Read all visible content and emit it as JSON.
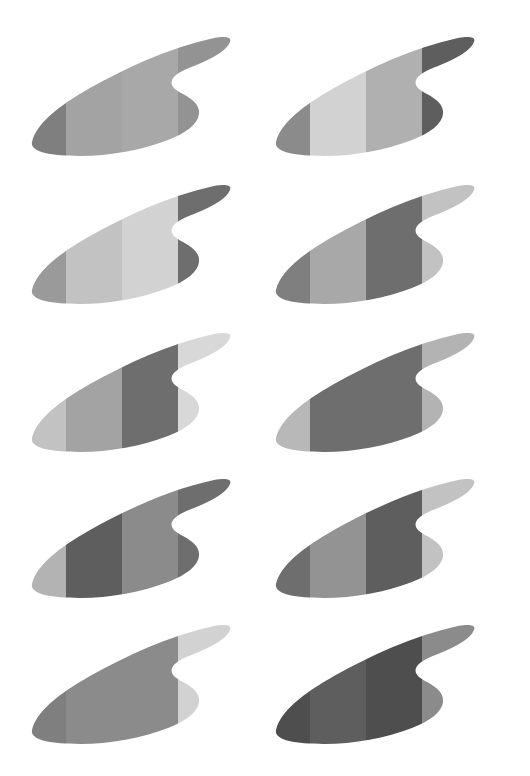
{
  "canvas": {
    "width": 530,
    "height": 776,
    "background": "#ffffff",
    "title": "Fin silhouette grid"
  },
  "grid": {
    "columns": 2,
    "rows": 5,
    "cell_width": 245,
    "cell_height": 150,
    "column_x": [
      18,
      262
    ],
    "row_y": [
      20,
      168,
      316,
      462,
      608
    ]
  },
  "shape": {
    "name": "banded-fin",
    "viewbox": "0 0 245 150",
    "outline_path": "M 14 122 C 18 104, 40 86, 72 68 C 108 48, 150 28, 196 18 C 208 16, 214 17, 212 22 C 209 30, 196 38, 176 46 C 163 51, 156 55, 154 60 C 152 66, 157 70, 165 74 C 176 80, 182 86, 181 94 C 180 104, 168 113, 150 120 C 124 130, 92 136, 62 136 C 32 136, 12 132, 14 122 Z",
    "band_boundaries_x": [
      48,
      104,
      160
    ],
    "band_count": 4,
    "band_label_left": "band-1",
    "band_label_mid_left": "band-2",
    "band_label_mid_right": "band-3",
    "band_label_right": "band-4"
  },
  "palette": {
    "lightest": "#e3e3e3",
    "very_light": "#d2d2d2",
    "light": "#c2c2c2",
    "light_mid": "#b3b3b3",
    "mid": "#a3a3a3",
    "mid_dark": "#939393",
    "dark_mid": "#7f7f7f",
    "dark": "#6e6e6e",
    "darker": "#5e5e5e",
    "darkest": "#4e4e4e",
    "white": "#ffffff"
  },
  "figures": [
    {
      "id": "fin-r1c1",
      "row": 1,
      "column": 1,
      "label": "fin-row1-left",
      "bands": [
        "#7f7f7f",
        "#a3a3a3",
        "#a8a8a8",
        "#939393"
      ]
    },
    {
      "id": "fin-r1c2",
      "row": 1,
      "column": 2,
      "label": "fin-row1-right",
      "bands": [
        "#8b8b8b",
        "#d2d2d2",
        "#b0b0b0",
        "#5e5e5e"
      ]
    },
    {
      "id": "fin-r2c1",
      "row": 2,
      "column": 1,
      "label": "fin-row2-left",
      "bands": [
        "#9a9a9a",
        "#c2c2c2",
        "#d2d2d2",
        "#6e6e6e"
      ]
    },
    {
      "id": "fin-r2c2",
      "row": 2,
      "column": 2,
      "label": "fin-row2-right",
      "bands": [
        "#7f7f7f",
        "#a8a8a8",
        "#6e6e6e",
        "#c2c2c2"
      ]
    },
    {
      "id": "fin-r3c1",
      "row": 3,
      "column": 1,
      "label": "fin-row3-left",
      "bands": [
        "#c2c2c2",
        "#a3a3a3",
        "#6e6e6e",
        "#d8d8d8"
      ]
    },
    {
      "id": "fin-r3c2",
      "row": 3,
      "column": 2,
      "label": "fin-row3-right",
      "bands": [
        "#b8b8b8",
        "#6e6e6e",
        "#6e6e6e",
        "#b3b3b3"
      ]
    },
    {
      "id": "fin-r4c1",
      "row": 4,
      "column": 1,
      "label": "fin-row4-left",
      "bands": [
        "#b3b3b3",
        "#5e5e5e",
        "#8b8b8b",
        "#6e6e6e"
      ]
    },
    {
      "id": "fin-r4c2",
      "row": 4,
      "column": 2,
      "label": "fin-row4-right",
      "bands": [
        "#6e6e6e",
        "#939393",
        "#5e5e5e",
        "#c2c2c2"
      ]
    },
    {
      "id": "fin-r5c1",
      "row": 5,
      "column": 1,
      "label": "fin-row5-left",
      "bands": [
        "#7f7f7f",
        "#8b8b8b",
        "#8b8b8b",
        "#d2d2d2"
      ]
    },
    {
      "id": "fin-r5c2",
      "row": 5,
      "column": 2,
      "label": "fin-row5-right",
      "bands": [
        "#4e4e4e",
        "#5e5e5e",
        "#4e4e4e",
        "#8b8b8b"
      ]
    }
  ]
}
